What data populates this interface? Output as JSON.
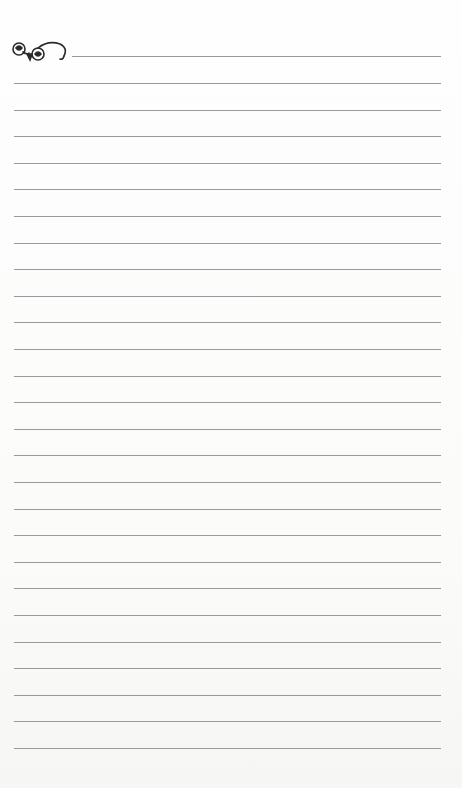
{
  "page": {
    "type": "lined-notepaper",
    "ornament": {
      "icon": "flourish-scroll-icon",
      "color": "#2a2a2a"
    },
    "line_color": "#9a9a9a",
    "line_count": 27,
    "first_line": {
      "y": 56,
      "x_start": 72,
      "x_end": 441
    },
    "lines": {
      "x_start": 14,
      "x_end": 441,
      "first_y": 83,
      "spacing": 26.6
    }
  }
}
